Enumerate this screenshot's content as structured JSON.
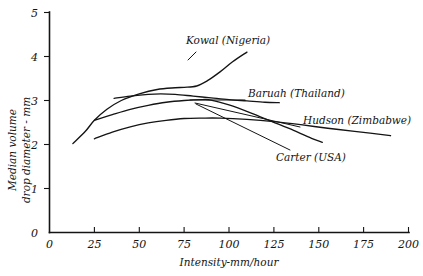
{
  "chart_data": {
    "type": "line",
    "title": "",
    "subtitle": "",
    "xlabel": "Intensity-mm/hour",
    "ylabel_line1": "Median volume",
    "ylabel_line2": "drop diameter - mm",
    "xlim": [
      0,
      200
    ],
    "ylim": [
      0,
      5
    ],
    "xticks": [
      0,
      25,
      50,
      75,
      100,
      125,
      150,
      175,
      200
    ],
    "xtick_labels": [
      "0",
      "25",
      "50",
      "75",
      "100",
      "125",
      "150",
      "175",
      "200"
    ],
    "yticks": [
      0,
      1,
      2,
      3,
      4,
      5
    ],
    "ytick_labels": [
      "0",
      "1",
      "2",
      "3",
      "4",
      "5"
    ],
    "grid": false,
    "legend_position": "inline-annotations",
    "line_color": "#141414",
    "background_color": "#ffffff",
    "series": [
      {
        "name": "Kowal (Nigeria)",
        "label": "Kowal (Nigeria)",
        "x": [
          13,
          20,
          25,
          32,
          40,
          50,
          60,
          70,
          75,
          82,
          88,
          95,
          102,
          110
        ],
        "y": [
          2.02,
          2.3,
          2.55,
          2.8,
          3.0,
          3.15,
          3.25,
          3.29,
          3.3,
          3.33,
          3.45,
          3.65,
          3.88,
          4.1
        ]
      },
      {
        "name": "Baruah (Thailand)",
        "label": "Baruah (Thailand)",
        "x": [
          36,
          45,
          55,
          62,
          70,
          80,
          90,
          100,
          110,
          120,
          128
        ],
        "y": [
          3.05,
          3.1,
          3.14,
          3.15,
          3.14,
          3.1,
          3.06,
          3.02,
          2.99,
          2.96,
          2.95
        ]
      },
      {
        "name": "Hudson (Zimbabwe)",
        "label": "Hudson (Zimbabwe)",
        "x": [
          25,
          35,
          45,
          55,
          65,
          75,
          85,
          95,
          110,
          125,
          140,
          155,
          170,
          190
        ],
        "y": [
          2.13,
          2.28,
          2.4,
          2.49,
          2.55,
          2.59,
          2.6,
          2.6,
          2.57,
          2.52,
          2.45,
          2.37,
          2.3,
          2.2
        ]
      },
      {
        "name": "Carter (USA)",
        "label": "Carter (USA)",
        "x": [
          25,
          35,
          45,
          55,
          65,
          75,
          85,
          90,
          100,
          112,
          124,
          136,
          146,
          152
        ],
        "y": [
          2.55,
          2.68,
          2.8,
          2.89,
          2.96,
          3.0,
          3.02,
          3.01,
          2.9,
          2.72,
          2.52,
          2.32,
          2.14,
          2.05
        ]
      }
    ]
  },
  "annotations": {
    "kowal": {
      "text": "Kowal (Nigeria)",
      "x": 186,
      "y": 44
    },
    "baruah": {
      "text": "Baruah (Thailand)",
      "x": 248,
      "y": 95
    },
    "hudson": {
      "text": "Hudson (Zimbabwe)",
      "x": 303,
      "y": 124
    },
    "carter": {
      "text": "Carter (USA)",
      "x": 276,
      "y": 160
    }
  }
}
